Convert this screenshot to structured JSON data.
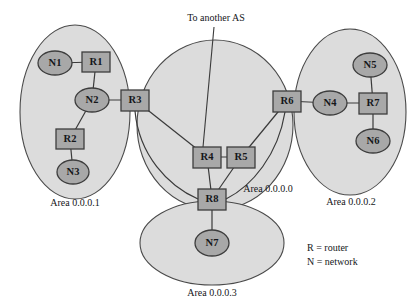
{
  "diagram": {
    "colors": {
      "area_fill": "#dcdcdc",
      "area_stroke": "#4a4a4a",
      "node_fill": "#a8a8a8",
      "node_stroke": "#3d3d3d",
      "link": "#3a3a3a",
      "text": "#15171a",
      "background": "#ffffff"
    },
    "areas": [
      {
        "id": "area1",
        "label": "Area 0.0.0.1",
        "shape": "ellipse",
        "cx": 75,
        "cy": 112,
        "rx": 55,
        "ry": 87,
        "label_x": 75,
        "label_y": 204
      },
      {
        "id": "area0",
        "label": "Area 0.0.0.0",
        "shape": "ellipse",
        "cx": 215,
        "cy": 125,
        "rx": 78,
        "ry": 85,
        "label_x": 268,
        "label_y": 190
      },
      {
        "id": "area2",
        "label": "Area 0.0.0.2",
        "shape": "ellipse",
        "cx": 350,
        "cy": 112,
        "rx": 56,
        "ry": 83,
        "label_x": 351,
        "label_y": 203
      },
      {
        "id": "area3",
        "label": "Area 0.0.0.3",
        "shape": "ellipse",
        "cx": 212,
        "cy": 243,
        "rx": 72,
        "ry": 42,
        "label_x": 212,
        "label_y": 294
      }
    ],
    "nodes": [
      {
        "id": "N1",
        "label": "N1",
        "type": "network",
        "x": 55,
        "y": 63,
        "rx": 17,
        "ry": 12
      },
      {
        "id": "R1",
        "label": "R1",
        "type": "router",
        "x": 96,
        "y": 62,
        "w": 28,
        "h": 20
      },
      {
        "id": "N2",
        "label": "N2",
        "type": "network",
        "x": 92,
        "y": 100,
        "rx": 17,
        "ry": 12
      },
      {
        "id": "R2",
        "label": "R2",
        "type": "router",
        "x": 70,
        "y": 139,
        "w": 28,
        "h": 20
      },
      {
        "id": "N3",
        "label": "N3",
        "type": "network",
        "x": 73,
        "y": 172,
        "rx": 16,
        "ry": 12
      },
      {
        "id": "R3",
        "label": "R3",
        "type": "router",
        "x": 135,
        "y": 100,
        "w": 28,
        "h": 21
      },
      {
        "id": "R4",
        "label": "R4",
        "type": "router",
        "x": 207,
        "y": 157,
        "w": 28,
        "h": 21
      },
      {
        "id": "R5",
        "label": "R5",
        "type": "router",
        "x": 241,
        "y": 157,
        "w": 28,
        "h": 21
      },
      {
        "id": "R8",
        "label": "R8",
        "type": "router",
        "x": 212,
        "y": 199,
        "w": 28,
        "h": 21
      },
      {
        "id": "N7",
        "label": "N7",
        "type": "network",
        "x": 212,
        "y": 243,
        "rx": 17,
        "ry": 13
      },
      {
        "id": "R6",
        "label": "R6",
        "type": "router",
        "x": 287,
        "y": 101,
        "w": 28,
        "h": 21
      },
      {
        "id": "N4",
        "label": "N4",
        "type": "network",
        "x": 330,
        "y": 103,
        "rx": 17,
        "ry": 12
      },
      {
        "id": "R7",
        "label": "R7",
        "type": "router",
        "x": 373,
        "y": 103,
        "w": 28,
        "h": 21
      },
      {
        "id": "N5",
        "label": "N5",
        "type": "network",
        "x": 370,
        "y": 65,
        "rx": 17,
        "ry": 12
      },
      {
        "id": "N6",
        "label": "N6",
        "type": "network",
        "x": 373,
        "y": 141,
        "rx": 17,
        "ry": 12
      }
    ],
    "links": [
      {
        "from": "N1",
        "to": "R1"
      },
      {
        "from": "R1",
        "to": "N2"
      },
      {
        "from": "N2",
        "to": "R2"
      },
      {
        "from": "R2",
        "to": "N3"
      },
      {
        "from": "N2",
        "to": "R3"
      },
      {
        "from": "R3",
        "to": "R4"
      },
      {
        "from": "R3",
        "to": "R8"
      },
      {
        "from": "R4",
        "to": "R5"
      },
      {
        "from": "R4",
        "to": "R8"
      },
      {
        "from": "R5",
        "to": "R6"
      },
      {
        "from": "R5",
        "to": "R8"
      },
      {
        "from": "R6",
        "to": "R8"
      },
      {
        "from": "R8",
        "to": "N7"
      },
      {
        "from": "R6",
        "to": "N4"
      },
      {
        "from": "N4",
        "to": "R7"
      },
      {
        "from": "R7",
        "to": "N5"
      },
      {
        "from": "R7",
        "to": "N6"
      }
    ],
    "annotations": [
      {
        "id": "to-another-as",
        "label": "To another AS",
        "label_x": 216,
        "label_y": 19,
        "line_from_x": 214,
        "line_from_y": 27,
        "line_to_x": 203,
        "line_to_y": 147
      }
    ],
    "legend": {
      "x": 307,
      "y": 249,
      "entries": [
        {
          "symbol": "R",
          "separator": "=",
          "meaning": "router",
          "text": "R = router"
        },
        {
          "symbol": "N",
          "separator": "=",
          "meaning": "network",
          "text": "N = network"
        }
      ]
    }
  }
}
